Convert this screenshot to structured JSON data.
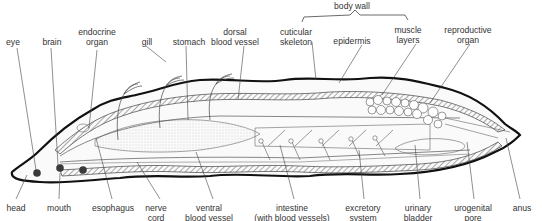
{
  "diagram": {
    "group_label": "body wall",
    "top_labels": [
      {
        "id": "eye",
        "lines": [
          "eye"
        ],
        "x": 13,
        "y": 37
      },
      {
        "id": "brain",
        "lines": [
          "brain"
        ],
        "x": 52,
        "y": 37
      },
      {
        "id": "endocrine-organ",
        "lines": [
          "endocrine",
          "organ"
        ],
        "x": 97,
        "y": 26
      },
      {
        "id": "gill",
        "lines": [
          "gill"
        ],
        "x": 147,
        "y": 37
      },
      {
        "id": "stomach",
        "lines": [
          "stomach"
        ],
        "x": 189,
        "y": 37
      },
      {
        "id": "dorsal-blood-vessel",
        "lines": [
          "dorsal",
          "blood vessel"
        ],
        "x": 235,
        "y": 26
      },
      {
        "id": "cuticular-skeleton",
        "lines": [
          "cuticular",
          "skeleton"
        ],
        "x": 296,
        "y": 26
      },
      {
        "id": "epidermis",
        "lines": [
          "epidermis"
        ],
        "x": 352,
        "y": 37
      },
      {
        "id": "muscle-layers",
        "lines": [
          "muscle",
          "layers"
        ],
        "x": 408,
        "y": 26
      },
      {
        "id": "reproductive-organ",
        "lines": [
          "reproductive",
          "organ"
        ],
        "x": 468,
        "y": 26
      }
    ],
    "bottom_labels": [
      {
        "id": "head",
        "lines": [
          "head"
        ],
        "x": 16,
        "y": 202
      },
      {
        "id": "mouth",
        "lines": [
          "mouth"
        ],
        "x": 59,
        "y": 202
      },
      {
        "id": "esophagus",
        "lines": [
          "esophagus"
        ],
        "x": 113,
        "y": 202
      },
      {
        "id": "nerve-cord",
        "lines": [
          "nerve",
          "cord"
        ],
        "x": 156,
        "y": 202
      },
      {
        "id": "ventral-blood-vessel",
        "lines": [
          "ventral",
          "blood vessel"
        ],
        "x": 209,
        "y": 202
      },
      {
        "id": "intestine",
        "lines": [
          "intestine",
          "(with blood vessels)"
        ],
        "x": 292,
        "y": 202
      },
      {
        "id": "excretory-system",
        "lines": [
          "excretory",
          "system"
        ],
        "x": 363,
        "y": 202
      },
      {
        "id": "urinary-bladder",
        "lines": [
          "urinary",
          "bladder"
        ],
        "x": 418,
        "y": 202
      },
      {
        "id": "urogenital-pore",
        "lines": [
          "urogenital",
          "pore"
        ],
        "x": 473,
        "y": 202
      },
      {
        "id": "anus",
        "lines": [
          "anus"
        ],
        "x": 522,
        "y": 202
      }
    ],
    "colors": {
      "ink": "#1a1a1a",
      "text": "#333333",
      "dot": "#3a3a3a",
      "fill": "#f4f4f4"
    }
  }
}
